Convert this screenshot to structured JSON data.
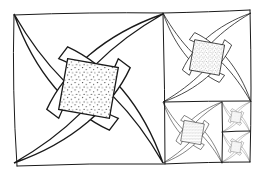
{
  "image": {
    "description": "Hand-drawn black ink line illustration of a golden-rectangle style spiral tiling: nested squares, each containing a pinwheel of four curved interwoven bands around a stippled center square.",
    "colors": {
      "ink": "#1a1a1a",
      "paper": "#ffffff",
      "stipple": "#9a9a9a"
    }
  },
  "tiles": [
    {
      "id": "large",
      "x": 14,
      "y": 14,
      "size": 149
    },
    {
      "id": "medium",
      "x": 163,
      "y": 13,
      "size": 88
    },
    {
      "id": "small",
      "x": 163,
      "y": 102,
      "size": 60
    },
    {
      "id": "tiny-top",
      "x": 222,
      "y": 102,
      "size": 28
    },
    {
      "id": "tiny-bottom",
      "x": 222,
      "y": 132,
      "size": 30
    }
  ]
}
